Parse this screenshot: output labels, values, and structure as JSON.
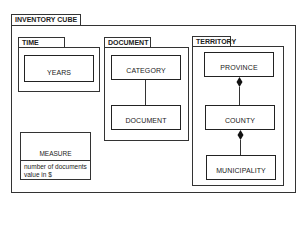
{
  "cube": {
    "title": "INVENTORY CUBE",
    "packages": [
      {
        "name": "TIME",
        "classes": [
          "YEARS"
        ]
      },
      {
        "name": "DOCUMENT",
        "classes": [
          "CATEGORY",
          "DOCUMENT"
        ]
      },
      {
        "name": "TERRITORY",
        "classes": [
          "PROVINCE",
          "COUNTY",
          "MUNICIPALITY"
        ]
      }
    ],
    "measure": {
      "name": "MEASURE",
      "attributes": [
        "number of documents",
        "value in $"
      ]
    }
  },
  "relations": [
    {
      "from": "CATEGORY",
      "to": "DOCUMENT",
      "type": "association"
    },
    {
      "from": "PROVINCE",
      "to": "COUNTY",
      "type": "composition"
    },
    {
      "from": "COUNTY",
      "to": "MUNICIPALITY",
      "type": "composition"
    }
  ]
}
